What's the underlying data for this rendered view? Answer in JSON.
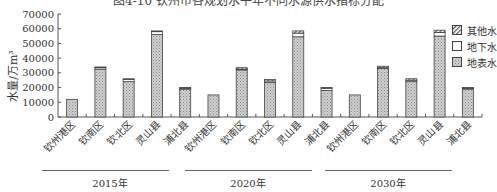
{
  "chart_data": {
    "type": "bar",
    "stacked": true,
    "title": "图4-10 钦州市各规划水平年不同水源供水指标分配",
    "xlabel": "",
    "ylabel": "水量/万m³",
    "ylim": [
      0,
      70000
    ],
    "yticks": [
      0,
      10000,
      20000,
      30000,
      40000,
      50000,
      60000,
      70000
    ],
    "grid": false,
    "legend_position": "top-right",
    "groups": [
      {
        "label": "2015年",
        "categories": [
          "钦州港区",
          "钦南区",
          "钦北区",
          "灵山县",
          "浦北县"
        ]
      },
      {
        "label": "2020年",
        "categories": [
          "钦州港区",
          "钦南区",
          "钦北区",
          "灵山县",
          "浦北县"
        ]
      },
      {
        "label": "2030年",
        "categories": [
          "钦州港区",
          "钦南区",
          "钦北区",
          "灵山县",
          "浦北县"
        ]
      }
    ],
    "categories": [
      "钦州港区",
      "钦南区",
      "钦北区",
      "灵山县",
      "浦北县",
      "钦州港区",
      "钦南区",
      "钦北区",
      "灵山县",
      "浦北县",
      "钦州港区",
      "钦南区",
      "钦北区",
      "灵山县",
      "浦北县"
    ],
    "series": [
      {
        "name": "地表水",
        "pattern": "dotted",
        "values": [
          12000,
          32500,
          24000,
          56000,
          19000,
          15000,
          32000,
          23500,
          54500,
          18000,
          15000,
          33000,
          24000,
          55000,
          19000
        ]
      },
      {
        "name": "地下水",
        "pattern": "white",
        "values": [
          0,
          1000,
          1500,
          2000,
          500,
          0,
          500,
          1000,
          2500,
          1500,
          0,
          500,
          1000,
          2500,
          500
        ]
      },
      {
        "name": "其他水",
        "pattern": "hatched",
        "values": [
          0,
          500,
          500,
          500,
          500,
          0,
          1000,
          1000,
          1500,
          500,
          0,
          1000,
          1000,
          1500,
          500
        ]
      }
    ]
  },
  "legend": [
    {
      "name": "其他水",
      "pattern": "hatched"
    },
    {
      "name": "地下水",
      "pattern": "white"
    },
    {
      "name": "地表水",
      "pattern": "dotted"
    }
  ],
  "ytick_labels": [
    "70000",
    "60000",
    "50000",
    "40000",
    "30000",
    "20000",
    "10000",
    "0"
  ],
  "title": "图4-10 钦州市各规划水平年不同水源供水指标分配",
  "ylabel": "水量/万m³",
  "year_labels": [
    "2015年",
    "2020年",
    "2030年"
  ]
}
